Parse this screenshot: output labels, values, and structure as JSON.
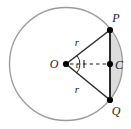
{
  "figure": {
    "type": "geometry-diagram",
    "canvas": {
      "width": 131,
      "height": 129,
      "background": "#ffffff"
    },
    "colors": {
      "circle_stroke": "#9a9a9a",
      "chord_stroke": "#2b2b2b",
      "radius_stroke": "#2b2b2b",
      "dashed_stroke": "#1a1a1a",
      "segment_fill": "#dcdcdc",
      "point_fill": "#000000",
      "label_color": "#1a1a1a"
    },
    "circle": {
      "center_label": "O",
      "center_x": 66,
      "center_y": 64,
      "radius": 56.5,
      "stroke_width": 1.2
    },
    "points": [
      {
        "id": "O",
        "label": "O",
        "x": 66,
        "y": 64,
        "label_x": 54,
        "label_y": 68,
        "marker": "dot"
      },
      {
        "id": "P",
        "label": "P",
        "x": 110,
        "y": 30,
        "label_x": 114,
        "label_y": 21,
        "marker": "dot"
      },
      {
        "id": "C",
        "label": "C",
        "x": 110,
        "y": 64,
        "label_x": 115,
        "label_y": 69,
        "marker": "dot"
      },
      {
        "id": "Q",
        "label": "Q",
        "x": 110,
        "y": 100,
        "label_x": 114,
        "label_y": 114,
        "marker": "dot"
      }
    ],
    "segments": [
      {
        "id": "OP",
        "from": "O",
        "to": "P",
        "style": "solid",
        "label": "r"
      },
      {
        "id": "OQ",
        "from": "O",
        "to": "Q",
        "style": "solid",
        "label": "r"
      },
      {
        "id": "PQ",
        "from": "P",
        "to": "Q",
        "style": "solid",
        "label": ""
      },
      {
        "id": "OC",
        "from": "O",
        "to": "C",
        "style": "dashed",
        "label": ""
      }
    ],
    "length_labels": [
      {
        "id": "r-upper",
        "text": "r",
        "x": 77,
        "y": 45
      },
      {
        "id": "r-lower",
        "text": "r",
        "x": 77,
        "y": 91
      }
    ],
    "angle": {
      "vertex": "O",
      "label": "t",
      "label_x": 77,
      "label_y": 68,
      "arc_radius": 14
    },
    "shaded_region": {
      "name": "circular-segment",
      "description": "Region bounded by chord PQ and the minor arc PQ",
      "fill": "#dcdcdc"
    },
    "tick_mark": {
      "id": "oc-tick",
      "x": 84,
      "y": 64,
      "description": "perpendicular bisector tick on OC"
    }
  }
}
